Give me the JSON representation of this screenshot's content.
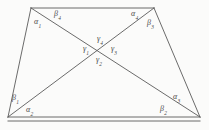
{
  "figure": {
    "background_color": "#fbfbfa",
    "stroke_color": "#5a5a5a",
    "label_color": "#4a4a4a",
    "vertices": {
      "top_left": [
        31,
        8
      ],
      "top_right": [
        154,
        8
      ],
      "bottom_right": [
        200,
        117
      ],
      "bottom_left": [
        8,
        117
      ]
    },
    "diagonal_intersection": [
      107,
      52
    ],
    "edges": [
      {
        "name": "top-edge",
        "from": "top_left",
        "to": "top_right"
      },
      {
        "name": "right-edge",
        "from": "top_right",
        "to": "bottom_right"
      },
      {
        "name": "bottom-edge",
        "from": "bottom_right",
        "to": "bottom_left"
      },
      {
        "name": "left-edge",
        "from": "bottom_left",
        "to": "top_left"
      },
      {
        "name": "diagonal-tl-br",
        "from": "top_left",
        "to": "bottom_right"
      },
      {
        "name": "diagonal-tr-bl",
        "from": "top_right",
        "to": "bottom_left"
      }
    ]
  },
  "labels": {
    "alpha_1": {
      "text": "α",
      "sub": "1",
      "x": 34,
      "y": 18
    },
    "beta_4": {
      "text": "β",
      "sub": "4",
      "x": 54,
      "y": 10
    },
    "alpha_4": {
      "text": "α",
      "sub": "4",
      "x": 131,
      "y": 10
    },
    "beta_3": {
      "text": "β",
      "sub": "3",
      "x": 147,
      "y": 19
    },
    "gamma_4": {
      "text": "γ",
      "sub": "4",
      "x": 97,
      "y": 35
    },
    "gamma_1": {
      "text": "γ",
      "sub": "1",
      "x": 83,
      "y": 45
    },
    "gamma_3": {
      "text": "γ",
      "sub": "3",
      "x": 111,
      "y": 45
    },
    "gamma_2": {
      "text": "γ",
      "sub": "2",
      "x": 96,
      "y": 56
    },
    "beta_1": {
      "text": "β",
      "sub": "1",
      "x": 12,
      "y": 94
    },
    "alpha_2": {
      "text": "α",
      "sub": "2",
      "x": 26,
      "y": 106
    },
    "alpha_3": {
      "text": "α",
      "sub": "3",
      "x": 173,
      "y": 93
    },
    "beta_2": {
      "text": "β",
      "sub": "2",
      "x": 160,
      "y": 105
    }
  }
}
